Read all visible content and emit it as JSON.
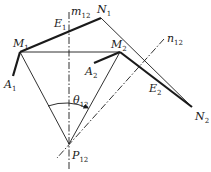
{
  "diagram": {
    "type": "kinematic-geometry",
    "colors": {
      "line": "#1a1a1a",
      "background": "#ffffff"
    },
    "points": {
      "M1": {
        "label": "M",
        "sub": "1",
        "x": 20,
        "y": 52
      },
      "N1": {
        "label": "N",
        "sub": "1",
        "x": 101,
        "y": 18
      },
      "A1": {
        "label": "A",
        "sub": "1",
        "x": 13,
        "y": 76
      },
      "M2": {
        "label": "M",
        "sub": "2",
        "x": 120,
        "y": 52
      },
      "N2": {
        "label": "N",
        "sub": "2",
        "x": 192,
        "y": 107
      },
      "A2": {
        "label": "A",
        "sub": "2",
        "x": 94,
        "y": 63
      },
      "P12": {
        "label": "P",
        "sub": "12",
        "x": 69,
        "y": 144
      },
      "E1": {
        "label": "E",
        "sub": "1"
      },
      "E2": {
        "label": "E",
        "sub": "2"
      }
    },
    "lines": {
      "m12": {
        "label": "m",
        "sub": "12",
        "style": "dash-dot"
      },
      "n12": {
        "label": "n",
        "sub": "12",
        "style": "dash-dot"
      }
    },
    "angle": {
      "label": "θ",
      "sub": "12"
    }
  }
}
